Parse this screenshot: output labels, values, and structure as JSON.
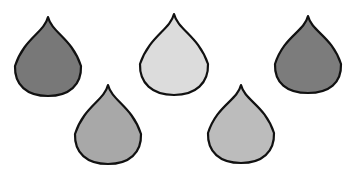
{
  "canvas": {
    "width": 352,
    "height": 174,
    "background_color": "#ffffff"
  },
  "figure": {
    "shape_kind": "teardrop",
    "shape_count": 5,
    "arrangement": "quincunx-three-top-two-bottom",
    "outline_color": "#111111",
    "outline_width": 2.2
  },
  "shapes": [
    {
      "id": "drop-1",
      "label": "top-left teardrop",
      "row": "top",
      "position": "left",
      "fill": "#787878",
      "shade": "dark-gray",
      "tip_x": 48,
      "tip_y": 17,
      "bulb_cx": 48,
      "bulb_cy": 68,
      "half_width": 33,
      "bottom_y": 96
    },
    {
      "id": "drop-2",
      "label": "top-middle teardrop",
      "row": "top",
      "position": "middle",
      "fill": "#dcdcdc",
      "shade": "very-light-gray",
      "tip_x": 174,
      "tip_y": 14,
      "bulb_cx": 174,
      "bulb_cy": 66,
      "half_width": 34,
      "bottom_y": 95
    },
    {
      "id": "drop-3",
      "label": "top-right teardrop",
      "row": "top",
      "position": "right",
      "fill": "#7c7c7c",
      "shade": "dark-gray",
      "tip_x": 308,
      "tip_y": 16,
      "bulb_cx": 308,
      "bulb_cy": 66,
      "half_width": 33,
      "bottom_y": 93
    },
    {
      "id": "drop-4",
      "label": "bottom-left teardrop",
      "row": "bottom",
      "position": "left",
      "fill": "#a8a8a8",
      "shade": "medium-gray",
      "tip_x": 108,
      "tip_y": 85,
      "bulb_cx": 108,
      "bulb_cy": 136,
      "half_width": 33,
      "bottom_y": 164
    },
    {
      "id": "drop-5",
      "label": "bottom-right teardrop",
      "row": "bottom",
      "position": "right",
      "fill": "#bcbcbc",
      "shade": "light-medium-gray",
      "tip_x": 241,
      "tip_y": 85,
      "bulb_cx": 241,
      "bulb_cy": 135,
      "half_width": 33,
      "bottom_y": 163
    }
  ]
}
